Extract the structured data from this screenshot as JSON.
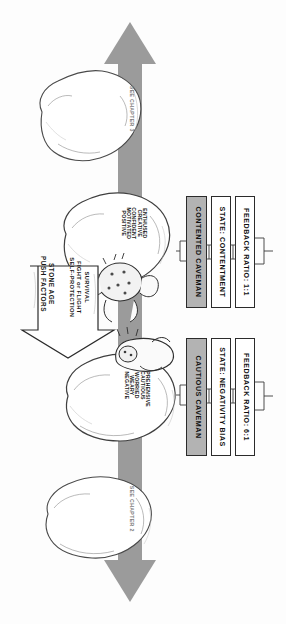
{
  "figure": {
    "title": "Stone Age Push Factors",
    "background_color": "#fdfdfd",
    "arrow_color": "#9b9b9b",
    "ink_color": "#1a1a1a",
    "header_fill": "#b3b3b3"
  },
  "axis_arrow": {
    "name": "vertical-double-arrow",
    "top_label_line1": "SEE",
    "top_label_line2": "CHAPTER",
    "top_label_line3": "3",
    "bottom_label_line1": "SEE",
    "bottom_label_line2": "CHAPTER",
    "bottom_label_line3": "2"
  },
  "push_factors": {
    "heading_line1": "STONE AGE",
    "heading_line2": "PUSH FACTORS",
    "items": [
      "SURVIVAL",
      "FIGHT or FLIGHT",
      "SELF-PROTECTION"
    ]
  },
  "upper_rock": {
    "name": "contented-rock",
    "moods": [
      "ENTHUSED",
      "CREATIVE",
      "CONFIDENT",
      "MOTIVATED",
      "POSITIVE"
    ]
  },
  "lower_rock": {
    "name": "cautious-rock",
    "moods": [
      "APPREHENSIVE",
      "CAUTIOUS",
      "WORRIED",
      "WEARY",
      "NEGATIVE"
    ]
  },
  "contented_panel": {
    "header": "CONTENTED CAVEMAN",
    "state": "STATE: CONTENTMENT",
    "ratio": "FEEDBACK RATIO: 1:1"
  },
  "cautious_panel": {
    "header": "CAUTIOUS CAVEMAN",
    "state": "STATE: NEGATIVITY BIAS",
    "ratio": "FEEDBACK RATIO: 6:1"
  }
}
